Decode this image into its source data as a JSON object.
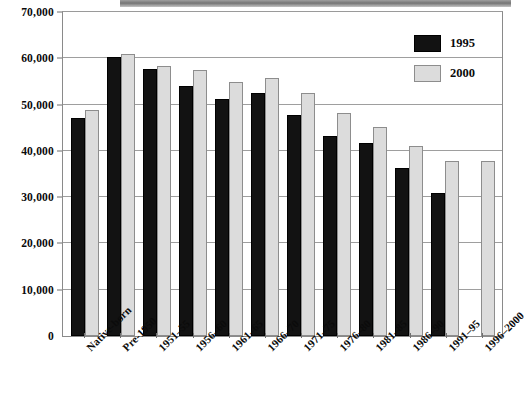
{
  "chart_data": {
    "type": "bar",
    "title": "",
    "xlabel": "",
    "ylabel": "",
    "ylim": [
      0,
      70000
    ],
    "yticks": [
      0,
      10000,
      20000,
      30000,
      40000,
      50000,
      60000,
      70000
    ],
    "ytick_labels": [
      "0",
      "10,000",
      "20,000",
      "30,000",
      "40,000",
      "50,000",
      "60,000",
      "70,000"
    ],
    "grid": true,
    "legend_position": "top-right",
    "categories": [
      "Native-born",
      "Pre-1950",
      "1951–55",
      "1956–60",
      "1961–65",
      "1966–70",
      "1971–75",
      "1976–80",
      "1981–85",
      "1986–90",
      "1991–95",
      "1996–2000"
    ],
    "series": [
      {
        "name": "1995",
        "color": "#121212",
        "values": [
          47000,
          60200,
          57600,
          54100,
          51200,
          52500,
          47800,
          43300,
          41800,
          36200,
          30800,
          null
        ]
      },
      {
        "name": "2000",
        "color": "#dcdcdc",
        "values": [
          48800,
          61000,
          58400,
          57500,
          54800,
          55800,
          52400,
          48100,
          45200,
          41000,
          37900,
          37800
        ]
      }
    ]
  }
}
